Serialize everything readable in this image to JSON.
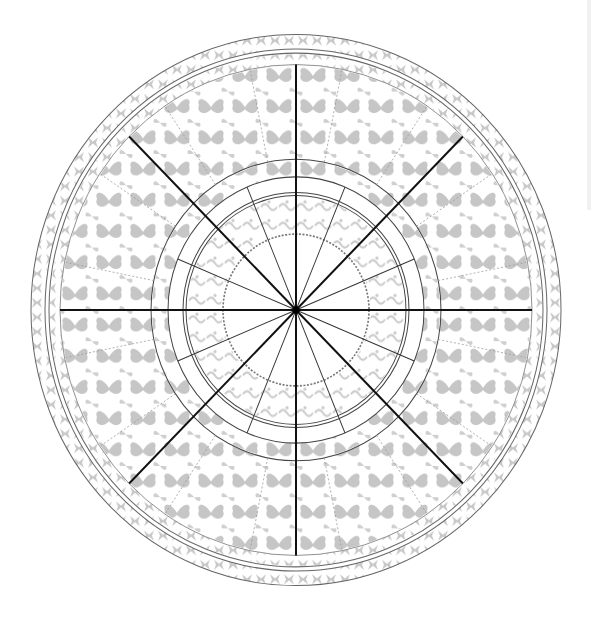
{
  "diagram": {
    "type": "mandala",
    "center": [
      296,
      310
    ],
    "radii": {
      "outer_border": 266,
      "outer_band_inner": 250,
      "pattern_band_outer": 244,
      "main_band_inner": 145,
      "ring_2": 128,
      "ring_3": 113,
      "ring_4": 110,
      "inner_dashed": 73
    },
    "bold_spokes": 8,
    "thin_spokes": 16,
    "colors": {
      "background": "#ffffff",
      "pattern_gray": "#c4c4c4",
      "ring_line": "#555555",
      "spoke": "#111111"
    }
  }
}
